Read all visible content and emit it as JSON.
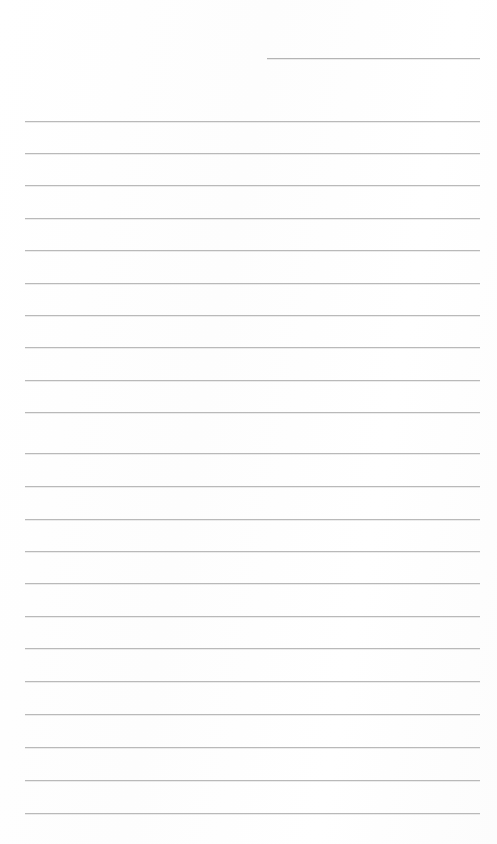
{
  "page": {
    "kind": "scanned-ruled-notebook-page",
    "width": 497,
    "height": 844,
    "background_color": "#ffffff",
    "rule_color": "#b9b9b9",
    "ink_color": "#1b1b1b",
    "written_text": [],
    "header_text": "",
    "footer_text": "",
    "page_number": ""
  },
  "ruling": {
    "left_margin_x": 25,
    "right_margin_x": 480,
    "line_thickness": 1,
    "line_spacing": 32.4,
    "first_full_line_y": 121,
    "rule_count": 23,
    "top_partial_rule": {
      "start_x": 267,
      "end_x": 480,
      "y": 58,
      "color": "#b4b4b4"
    },
    "rules": [
      {
        "id": "rule-top-partial",
        "y": 58,
        "x": 267,
        "width": 213,
        "shade": "short"
      },
      {
        "id": "rule-1",
        "y": 121,
        "x": 25,
        "width": 455,
        "shade": "normal"
      },
      {
        "id": "rule-2",
        "y": 153,
        "x": 25,
        "width": 455,
        "shade": "normal"
      },
      {
        "id": "rule-3",
        "y": 185,
        "x": 25,
        "width": 455,
        "shade": "normal"
      },
      {
        "id": "rule-4",
        "y": 218,
        "x": 25,
        "width": 455,
        "shade": "normal"
      },
      {
        "id": "rule-5",
        "y": 250,
        "x": 25,
        "width": 455,
        "shade": "normal"
      },
      {
        "id": "rule-6",
        "y": 283,
        "x": 25,
        "width": 455,
        "shade": "normal"
      },
      {
        "id": "rule-7",
        "y": 315,
        "x": 25,
        "width": 455,
        "shade": "normal"
      },
      {
        "id": "rule-8",
        "y": 347,
        "x": 25,
        "width": 455,
        "shade": "normal"
      },
      {
        "id": "rule-9",
        "y": 380,
        "x": 25,
        "width": 455,
        "shade": "normal"
      },
      {
        "id": "rule-10",
        "y": 412,
        "x": 25,
        "width": 455,
        "shade": "normal"
      },
      {
        "id": "rule-11",
        "y": 453,
        "x": 25,
        "width": 455,
        "shade": "normal"
      },
      {
        "id": "rule-12",
        "y": 486,
        "x": 25,
        "width": 455,
        "shade": "normal"
      },
      {
        "id": "rule-13",
        "y": 519,
        "x": 25,
        "width": 455,
        "shade": "normal"
      },
      {
        "id": "rule-14",
        "y": 551,
        "x": 25,
        "width": 455,
        "shade": "normal"
      },
      {
        "id": "rule-15",
        "y": 583,
        "x": 25,
        "width": 455,
        "shade": "normal"
      },
      {
        "id": "rule-16",
        "y": 616,
        "x": 25,
        "width": 455,
        "shade": "normal"
      },
      {
        "id": "rule-17",
        "y": 648,
        "x": 25,
        "width": 455,
        "shade": "normal"
      },
      {
        "id": "rule-18",
        "y": 681,
        "x": 25,
        "width": 455,
        "shade": "normal"
      },
      {
        "id": "rule-19",
        "y": 714,
        "x": 25,
        "width": 455,
        "shade": "normal"
      },
      {
        "id": "rule-20",
        "y": 747,
        "x": 25,
        "width": 455,
        "shade": "normal"
      },
      {
        "id": "rule-21",
        "y": 780,
        "x": 25,
        "width": 455,
        "shade": "normal"
      },
      {
        "id": "rule-22",
        "y": 813,
        "x": 25,
        "width": 455,
        "shade": "normal"
      }
    ]
  }
}
